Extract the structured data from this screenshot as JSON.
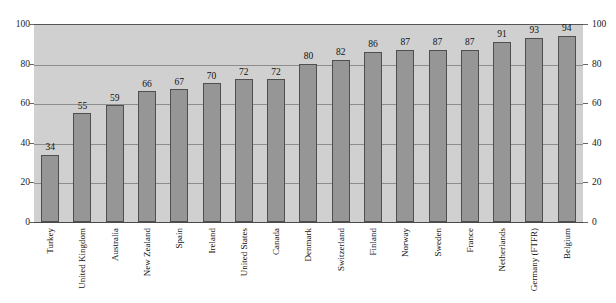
{
  "chart_data": {
    "type": "bar",
    "title": "",
    "subtitle": "",
    "xlabel": "",
    "ylabel": "",
    "ylim": [
      0,
      100
    ],
    "yticks": [
      0,
      20,
      40,
      60,
      80,
      100
    ],
    "grid": true,
    "legend": "none",
    "dual_y_axis": true,
    "categories": [
      "Turkey",
      "United Kingdom",
      "Australia",
      "New Zealand",
      "Spain",
      "Ireland",
      "United States",
      "Canada",
      "Denmark",
      "Switzerland",
      "Finland",
      "Norway",
      "Sweden",
      "France",
      "Netherlands",
      "Germany (FTFR)",
      "Belgium"
    ],
    "values": [
      34,
      55,
      59,
      66,
      67,
      70,
      72,
      72,
      80,
      82,
      86,
      87,
      87,
      87,
      91,
      93,
      94
    ],
    "bar_color": "#969696",
    "bar_border_color": "#4f4f4f",
    "plot_background": "#d0d0d0",
    "gridline_color": "#8d8d8d"
  }
}
